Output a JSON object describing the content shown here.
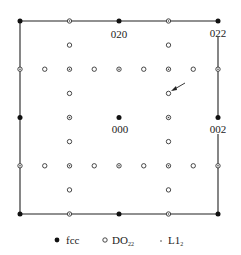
{
  "diagram": {
    "type": "electron diffraction pattern schematic",
    "frame": {
      "left": 20,
      "top": 21,
      "right": 218,
      "bottom": 214
    },
    "grid": {
      "x": [
        20,
        44.75,
        69.5,
        94.25,
        119,
        143.75,
        168.5,
        193.25,
        218
      ],
      "y": [
        21,
        45.1,
        69.2,
        93.4,
        117.5,
        141.6,
        165.8,
        189.9,
        214
      ]
    },
    "labels": {
      "spot_020": "020",
      "spot_022": "022",
      "spot_000": "000",
      "spot_002": "002"
    },
    "spots": {
      "fcc": [
        [
          0,
          0
        ],
        [
          4,
          0
        ],
        [
          8,
          0
        ],
        [
          0,
          4
        ],
        [
          4,
          4
        ],
        [
          8,
          4
        ],
        [
          0,
          8
        ],
        [
          4,
          8
        ],
        [
          8,
          8
        ]
      ],
      "do22_open": [
        [
          1,
          2
        ],
        [
          3,
          2
        ],
        [
          5,
          2
        ],
        [
          7,
          2
        ],
        [
          2,
          1
        ],
        [
          6,
          1
        ],
        [
          2,
          3
        ],
        [
          6,
          3
        ],
        [
          2,
          5
        ],
        [
          6,
          5
        ],
        [
          2,
          7
        ],
        [
          6,
          7
        ],
        [
          1,
          6
        ],
        [
          3,
          6
        ],
        [
          5,
          6
        ],
        [
          7,
          6
        ]
      ],
      "do22_with_l12": [
        [
          2,
          0
        ],
        [
          6,
          0
        ],
        [
          0,
          2
        ],
        [
          2,
          2
        ],
        [
          4,
          2
        ],
        [
          6,
          2
        ],
        [
          8,
          2
        ],
        [
          2,
          4
        ],
        [
          6,
          4
        ],
        [
          0,
          6
        ],
        [
          2,
          6
        ],
        [
          4,
          6
        ],
        [
          6,
          6
        ],
        [
          8,
          6
        ],
        [
          2,
          8
        ],
        [
          6,
          8
        ]
      ]
    },
    "arrow": {
      "from": [
        185,
        83
      ],
      "to": [
        171,
        91
      ]
    },
    "colors": {
      "line": "#222222",
      "fcc": "#111111",
      "open": "#333333",
      "l12_dot": "#444444"
    }
  },
  "legend": {
    "items": [
      {
        "symbol": "filled-dot",
        "label": "fcc"
      },
      {
        "symbol": "open-circle",
        "label": "DO",
        "subscript": "22"
      },
      {
        "symbol": "small-dot",
        "label": "L1",
        "subscript": "2"
      }
    ]
  }
}
